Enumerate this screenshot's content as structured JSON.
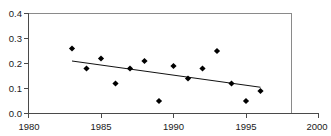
{
  "chart_data": {
    "type": "scatter",
    "title": "",
    "xlabel": "",
    "ylabel": "",
    "xlim": [
      1980,
      2000
    ],
    "ylim": [
      0.0,
      0.4
    ],
    "xticks": [
      "1980",
      "1985",
      "1990",
      "1995",
      "2000"
    ],
    "xtick_values": [
      1980,
      1985,
      1990,
      1995,
      2000
    ],
    "yticks": [
      "0.0",
      "0.1",
      "0.2",
      "0.3",
      "0.4"
    ],
    "ytick_values": [
      0.0,
      0.1,
      0.2,
      0.3,
      0.4
    ],
    "grid": false,
    "legend": "none",
    "marker": "filled-diamond",
    "marker_color": "#000000",
    "x": [
      1983,
      1984,
      1985,
      1986,
      1987,
      1988,
      1989,
      1990,
      1991,
      1992,
      1993,
      1994,
      1995,
      1996
    ],
    "values": [
      0.26,
      0.18,
      0.22,
      0.12,
      0.18,
      0.21,
      0.05,
      0.19,
      0.14,
      0.18,
      0.25,
      0.12,
      0.05,
      0.09
    ],
    "series": [
      {
        "name": "observations",
        "type": "scatter",
        "x": [
          1983,
          1984,
          1985,
          1986,
          1987,
          1988,
          1989,
          1990,
          1991,
          1992,
          1993,
          1994,
          1995,
          1996
        ],
        "values": [
          0.26,
          0.18,
          0.22,
          0.12,
          0.18,
          0.21,
          0.05,
          0.19,
          0.14,
          0.18,
          0.25,
          0.12,
          0.05,
          0.09
        ]
      },
      {
        "name": "trend-line",
        "type": "line",
        "x": [
          1983,
          1996
        ],
        "values": [
          0.21,
          0.105
        ]
      }
    ],
    "annotations": []
  },
  "axes": {
    "y_tick_labels": [
      "0.4",
      "0.3",
      "0.2",
      "0.1",
      "0.0"
    ],
    "x_tick_labels": [
      "1980",
      "1985",
      "1990",
      "1995",
      "2000"
    ]
  }
}
